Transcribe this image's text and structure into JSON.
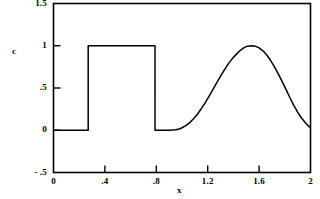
{
  "chart_data": {
    "type": "line",
    "title": "",
    "xlabel": "x",
    "ylabel": "c",
    "xlim": [
      0,
      2
    ],
    "ylim": [
      -0.5,
      1.5
    ],
    "grid": false,
    "legend": null,
    "x_ticks": [
      {
        "value": 0,
        "label": "0"
      },
      {
        "value": 0.4,
        "label": ".4"
      },
      {
        "value": 0.8,
        "label": ".8"
      },
      {
        "value": 1.2,
        "label": "1.2"
      },
      {
        "value": 1.6,
        "label": "1.6"
      },
      {
        "value": 2,
        "label": "2"
      }
    ],
    "y_ticks": [
      {
        "value": 1.5,
        "label": "1.5"
      },
      {
        "value": 1,
        "label": "1"
      },
      {
        "value": 0.5,
        "label": ".5"
      },
      {
        "value": 0,
        "label": "0"
      },
      {
        "value": -0.5,
        "- .5": null,
        "label": "- .5"
      }
    ],
    "series": [
      {
        "name": "c",
        "color": "#000000",
        "description": "square pulse plus smooth gaussian bump",
        "x": [
          0.0,
          0.05,
          0.1,
          0.15,
          0.2,
          0.25,
          0.265,
          0.27,
          0.27,
          0.3,
          0.35,
          0.4,
          0.45,
          0.5,
          0.55,
          0.6,
          0.65,
          0.7,
          0.75,
          0.785,
          0.79,
          0.79,
          0.8,
          0.82,
          0.85,
          0.9,
          0.95,
          0.98,
          1.0,
          1.03,
          1.06,
          1.09,
          1.12,
          1.15,
          1.18,
          1.21,
          1.24,
          1.27,
          1.3,
          1.33,
          1.36,
          1.39,
          1.42,
          1.45,
          1.48,
          1.51,
          1.54,
          1.57,
          1.6,
          1.63,
          1.66,
          1.69,
          1.72,
          1.75,
          1.78,
          1.81,
          1.84,
          1.87,
          1.9,
          1.93,
          1.96,
          1.98,
          2.0
        ],
        "y": [
          0.0,
          0.0,
          0.0,
          0.0,
          0.0,
          0.0,
          0.0,
          0.0,
          1.0,
          1.0,
          1.0,
          1.0,
          1.0,
          1.0,
          1.0,
          1.0,
          1.0,
          1.0,
          1.0,
          1.0,
          1.0,
          0.0,
          0.0,
          0.0,
          0.0,
          0.0,
          0.005,
          0.015,
          0.03,
          0.055,
          0.09,
          0.135,
          0.19,
          0.255,
          0.325,
          0.4,
          0.48,
          0.56,
          0.64,
          0.715,
          0.785,
          0.845,
          0.895,
          0.94,
          0.975,
          0.995,
          1.0,
          0.995,
          0.975,
          0.94,
          0.89,
          0.825,
          0.75,
          0.665,
          0.575,
          0.48,
          0.385,
          0.295,
          0.215,
          0.145,
          0.09,
          0.055,
          0.03
        ]
      }
    ],
    "features": {
      "square_pulse": {
        "x_start": 0.27,
        "x_end": 0.79,
        "height": 1.0
      },
      "gaussian_bump": {
        "peak_x": 1.55,
        "peak_y": 1.0,
        "x_start": 0.95,
        "x_end": 2.0
      }
    }
  }
}
